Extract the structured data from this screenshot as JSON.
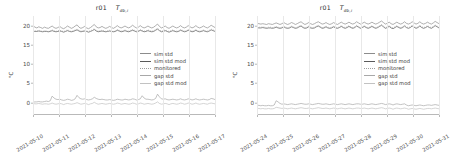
{
  "figure": {
    "panel_count": 2,
    "ylabel": "°C",
    "yticks": [
      0,
      5,
      10,
      15,
      20
    ],
    "ylim": [
      -3.2,
      22.5
    ],
    "legend_position": "center-right",
    "grid": "vertical-daily"
  },
  "chart_data": [
    {
      "type": "line",
      "title": "r01",
      "title_symbol": "T",
      "title_subscript": "db,i",
      "xlabel": "",
      "ylabel": "°C",
      "ylim": [
        -3.2,
        22.5
      ],
      "yticks": [
        0,
        5,
        10,
        15,
        20
      ],
      "x": [
        "2021-05-10",
        "2021-05-11",
        "2021-05-12",
        "2021-05-13",
        "2021-05-14",
        "2021-05-15",
        "2021-05-16",
        "2021-05-17"
      ],
      "legend": [
        "sim std",
        "sim std mod",
        "monitored",
        "gap std",
        "gap std mod"
      ],
      "colors": {
        "sim std": "#8c8c8c",
        "sim std mod": "#5a5a5a",
        "monitored": "#9e9e9e",
        "gap std": "#a8a8a8",
        "gap std mod": "#c2c2c2"
      },
      "series": [
        {
          "name": "sim std",
          "values": [
            20.0,
            19.6,
            19.4,
            19.7,
            19.5,
            19.3,
            19.6,
            19.4,
            19.3,
            19.6,
            19.9,
            19.5,
            19.3,
            19.5,
            19.8,
            19.4,
            19.2,
            19.5,
            19.9,
            19.6,
            19.3,
            19.5,
            19.9,
            20.2,
            19.6,
            19.3,
            19.5,
            19.8,
            19.4,
            19.2,
            19.5,
            19.9,
            20.3,
            19.7,
            19.4,
            19.5,
            19.8,
            19.5,
            19.3,
            19.5,
            19.8,
            19.5,
            19.3,
            19.6,
            20.0,
            19.6,
            19.4,
            19.6,
            19.9,
            19.6,
            19.4,
            19.7,
            20.1,
            19.7,
            19.4,
            19.6,
            20.0,
            19.6,
            19.4,
            19.6,
            19.9,
            19.6,
            19.4,
            19.6,
            20.0,
            20.4,
            19.8,
            19.4,
            19.6,
            19.9,
            19.5,
            19.3,
            19.6,
            19.9,
            19.6,
            19.4,
            19.6,
            20.0,
            19.6,
            19.4,
            19.6,
            20.0,
            19.7,
            19.4,
            19.6,
            20.0,
            19.6,
            19.4,
            19.6,
            19.9,
            19.6,
            19.4,
            19.7,
            20.1,
            19.8,
            19.5
          ]
        },
        {
          "name": "sim std mod",
          "values": [
            18.6,
            18.5,
            18.5,
            18.6,
            18.5,
            18.4,
            18.5,
            18.5,
            18.4,
            18.5,
            18.7,
            18.5,
            18.4,
            18.5,
            18.6,
            18.5,
            18.3,
            18.5,
            18.7,
            18.5,
            18.4,
            18.5,
            18.7,
            18.9,
            18.6,
            18.4,
            18.5,
            18.6,
            18.5,
            18.3,
            18.5,
            18.7,
            19.0,
            18.6,
            18.4,
            18.5,
            18.6,
            18.5,
            18.4,
            18.5,
            18.6,
            18.5,
            18.4,
            18.5,
            18.8,
            18.6,
            18.4,
            18.5,
            18.7,
            18.5,
            18.4,
            18.6,
            18.8,
            18.6,
            18.4,
            18.5,
            18.8,
            18.6,
            18.4,
            18.5,
            18.7,
            18.5,
            18.4,
            18.5,
            18.8,
            19.1,
            18.7,
            18.4,
            18.5,
            18.7,
            18.5,
            18.3,
            18.5,
            18.7,
            18.5,
            18.4,
            18.5,
            18.8,
            18.6,
            18.4,
            18.5,
            18.8,
            18.6,
            18.4,
            18.5,
            18.8,
            18.5,
            18.4,
            18.5,
            18.7,
            18.5,
            18.4,
            18.6,
            18.9,
            18.7,
            18.5
          ]
        },
        {
          "name": "monitored",
          "values": [
            18.8,
            18.6,
            18.6,
            18.8,
            18.7,
            18.5,
            18.7,
            18.6,
            18.5,
            18.7,
            18.9,
            18.7,
            18.5,
            18.7,
            18.8,
            18.6,
            18.5,
            18.7,
            18.9,
            18.7,
            18.5,
            18.7,
            18.9,
            19.1,
            18.8,
            18.6,
            18.7,
            18.8,
            18.6,
            18.5,
            18.7,
            18.9,
            19.2,
            18.8,
            18.6,
            18.7,
            18.8,
            18.7,
            18.5,
            18.7,
            18.8,
            18.7,
            18.5,
            18.7,
            19.0,
            18.8,
            18.6,
            18.7,
            18.9,
            18.7,
            18.6,
            18.8,
            19.0,
            18.8,
            18.6,
            18.7,
            19.0,
            18.8,
            18.6,
            18.7,
            18.9,
            18.7,
            18.6,
            18.7,
            19.0,
            19.3,
            18.9,
            18.6,
            18.7,
            18.9,
            18.7,
            18.5,
            18.7,
            18.9,
            18.7,
            18.6,
            18.7,
            19.0,
            18.8,
            18.6,
            18.7,
            19.0,
            18.8,
            18.6,
            18.7,
            19.0,
            18.7,
            18.6,
            18.7,
            18.9,
            18.7,
            18.6,
            18.8,
            19.1,
            18.9,
            18.7
          ]
        },
        {
          "name": "gap std",
          "values": [
            0.1,
            0.2,
            0.2,
            0.3,
            0.2,
            0.2,
            0.3,
            0.4,
            0.3,
            0.5,
            1.7,
            1.2,
            0.9,
            0.8,
            0.9,
            0.7,
            0.6,
            0.7,
            0.9,
            0.8,
            0.6,
            0.7,
            1.0,
            1.9,
            1.3,
            1.0,
            0.9,
            1.0,
            0.8,
            0.7,
            0.8,
            1.0,
            1.4,
            1.1,
            0.9,
            0.8,
            0.9,
            0.8,
            0.7,
            0.7,
            0.8,
            0.7,
            0.6,
            0.7,
            0.9,
            0.8,
            0.7,
            0.7,
            0.9,
            0.8,
            0.7,
            0.8,
            1.0,
            0.9,
            0.7,
            0.8,
            1.0,
            1.8,
            1.2,
            0.9,
            0.9,
            0.8,
            0.7,
            0.8,
            1.1,
            2.2,
            1.5,
            1.0,
            0.9,
            1.0,
            0.8,
            0.7,
            0.8,
            0.9,
            0.8,
            0.7,
            0.8,
            1.0,
            0.8,
            0.7,
            0.8,
            1.0,
            0.9,
            0.7,
            0.8,
            1.0,
            0.8,
            0.7,
            0.8,
            0.9,
            0.8,
            0.7,
            0.8,
            1.1,
            1.0,
            0.8
          ]
        },
        {
          "name": "gap std mod",
          "values": [
            -0.2,
            -0.3,
            -0.3,
            -0.2,
            -0.3,
            -0.4,
            -0.3,
            -0.3,
            -0.4,
            -0.3,
            -0.1,
            -0.3,
            -0.4,
            -0.3,
            -0.2,
            -0.3,
            -0.5,
            -0.3,
            -0.2,
            -0.3,
            -0.4,
            -0.3,
            -0.2,
            0.0,
            -0.2,
            -0.4,
            -0.3,
            -0.2,
            -0.3,
            -0.5,
            -0.3,
            -0.2,
            0.1,
            -0.2,
            -0.4,
            -0.3,
            -0.2,
            -0.3,
            -0.4,
            -0.3,
            -0.2,
            -0.3,
            -0.4,
            -0.3,
            -0.1,
            -0.2,
            -0.4,
            -0.3,
            -0.2,
            -0.3,
            -0.4,
            -0.3,
            -0.1,
            -0.2,
            -0.4,
            -0.3,
            -0.1,
            -0.2,
            -0.4,
            -0.3,
            -0.2,
            -0.3,
            -0.4,
            -0.3,
            -0.1,
            0.2,
            -0.2,
            -0.4,
            -0.3,
            -0.2,
            -0.3,
            -0.5,
            -0.3,
            -0.2,
            -0.3,
            -0.4,
            -0.3,
            -0.1,
            -0.2,
            -0.4,
            -0.3,
            -0.1,
            -0.2,
            -0.4,
            -0.3,
            -0.1,
            -0.3,
            -0.4,
            -0.3,
            -0.2,
            -0.3,
            -0.4,
            -0.2,
            -0.1,
            -0.2,
            -0.3
          ]
        }
      ]
    },
    {
      "type": "line",
      "title": "r01",
      "title_symbol": "T",
      "title_subscript": "db,i",
      "xlabel": "",
      "ylabel": "°C",
      "ylim": [
        -3.2,
        22.5
      ],
      "yticks": [
        0,
        5,
        10,
        15,
        20
      ],
      "x": [
        "2021-05-24",
        "2021-05-25",
        "2021-05-26",
        "2021-05-27",
        "2021-05-28",
        "2021-05-29",
        "2021-05-30",
        "2021-05-31"
      ],
      "legend": [
        "sim std",
        "sim std mod",
        "monitored",
        "gap std",
        "gap std mod"
      ],
      "colors": {
        "sim std": "#8c8c8c",
        "sim std mod": "#5a5a5a",
        "monitored": "#9e9e9e",
        "gap std": "#a8a8a8",
        "gap std mod": "#c2c2c2"
      },
      "series": [
        {
          "name": "sim std",
          "values": [
            20.6,
            20.5,
            20.4,
            20.5,
            20.4,
            20.3,
            20.5,
            20.4,
            20.3,
            20.5,
            20.7,
            20.5,
            20.3,
            20.5,
            20.8,
            20.5,
            20.3,
            20.5,
            20.8,
            20.6,
            20.3,
            20.5,
            20.8,
            21.0,
            20.6,
            20.3,
            20.5,
            20.8,
            20.5,
            20.3,
            20.5,
            20.8,
            21.0,
            20.7,
            20.4,
            20.5,
            20.8,
            20.5,
            20.3,
            20.5,
            20.8,
            20.5,
            20.3,
            20.6,
            20.9,
            20.6,
            20.4,
            20.6,
            20.9,
            20.6,
            20.4,
            20.6,
            21.0,
            20.7,
            20.4,
            20.6,
            20.9,
            20.6,
            20.4,
            20.6,
            20.9,
            20.6,
            20.4,
            20.6,
            20.9,
            21.2,
            20.8,
            20.4,
            20.6,
            20.9,
            20.5,
            20.3,
            20.6,
            20.9,
            20.6,
            20.4,
            20.6,
            21.0,
            20.6,
            20.4,
            20.6,
            21.0,
            20.7,
            20.4,
            20.6,
            21.0,
            20.6,
            20.4,
            20.6,
            20.9,
            20.6,
            20.4,
            20.7,
            21.1,
            20.8,
            20.5
          ]
        },
        {
          "name": "sim std mod",
          "values": [
            19.5,
            19.4,
            19.4,
            19.5,
            19.4,
            19.3,
            19.4,
            19.4,
            19.3,
            19.4,
            19.6,
            19.4,
            19.3,
            19.4,
            19.7,
            19.4,
            19.3,
            19.4,
            19.7,
            19.5,
            19.3,
            19.4,
            19.7,
            19.9,
            19.5,
            19.3,
            19.4,
            19.7,
            19.4,
            19.3,
            19.4,
            19.7,
            19.9,
            19.6,
            19.3,
            19.4,
            19.7,
            19.4,
            19.3,
            19.4,
            19.7,
            19.4,
            19.3,
            19.5,
            19.8,
            19.5,
            19.3,
            19.5,
            19.8,
            19.5,
            19.3,
            19.5,
            19.9,
            19.6,
            19.3,
            19.5,
            19.8,
            19.5,
            19.3,
            19.5,
            19.8,
            19.5,
            19.3,
            19.5,
            19.8,
            20.1,
            19.7,
            19.3,
            19.5,
            19.8,
            19.4,
            19.2,
            19.5,
            19.8,
            19.5,
            19.3,
            19.5,
            19.9,
            19.5,
            19.3,
            19.5,
            19.9,
            19.6,
            19.3,
            19.5,
            19.9,
            19.5,
            19.3,
            19.5,
            19.8,
            19.5,
            19.3,
            19.6,
            20.0,
            19.7,
            19.4
          ]
        },
        {
          "name": "monitored",
          "values": [
            19.7,
            19.6,
            19.6,
            19.7,
            19.6,
            19.5,
            19.6,
            19.6,
            19.5,
            19.6,
            19.8,
            19.6,
            19.5,
            19.6,
            19.9,
            19.6,
            19.5,
            19.6,
            19.9,
            19.7,
            19.5,
            19.6,
            19.9,
            20.1,
            19.7,
            19.5,
            19.6,
            19.9,
            19.6,
            19.5,
            19.6,
            19.9,
            20.1,
            19.8,
            19.5,
            19.6,
            19.9,
            19.6,
            19.5,
            19.6,
            19.9,
            19.6,
            19.5,
            19.7,
            20.0,
            19.7,
            19.5,
            19.7,
            20.0,
            19.7,
            19.5,
            19.7,
            20.1,
            19.8,
            19.5,
            19.7,
            20.0,
            19.7,
            19.5,
            19.7,
            20.0,
            19.7,
            19.5,
            19.7,
            20.0,
            20.3,
            19.9,
            19.5,
            19.7,
            20.0,
            19.6,
            19.4,
            19.7,
            20.0,
            19.7,
            19.5,
            19.7,
            20.1,
            19.7,
            19.5,
            19.7,
            20.1,
            19.8,
            19.5,
            19.7,
            20.1,
            19.7,
            19.5,
            19.7,
            20.0,
            19.7,
            19.5,
            19.8,
            20.2,
            19.9,
            19.6
          ]
        },
        {
          "name": "gap std",
          "values": [
            -0.7,
            -0.7,
            -0.8,
            -0.7,
            -0.8,
            -0.8,
            -0.7,
            -0.8,
            -0.8,
            -0.6,
            0.5,
            0.2,
            -0.2,
            -0.4,
            -0.3,
            -0.4,
            -0.5,
            -0.4,
            -0.3,
            -0.4,
            -0.5,
            -0.4,
            -0.3,
            -0.2,
            -0.3,
            -0.4,
            -0.4,
            -0.3,
            -0.4,
            -0.5,
            -0.4,
            -0.3,
            -0.2,
            -0.3,
            -0.4,
            -0.4,
            -0.3,
            -0.4,
            -0.5,
            -0.4,
            -0.3,
            -0.4,
            -0.5,
            -0.4,
            -0.3,
            -0.4,
            -0.5,
            -0.4,
            -0.3,
            -0.4,
            -0.5,
            -0.4,
            -0.3,
            -0.3,
            -0.4,
            -0.4,
            -0.3,
            -0.4,
            -0.5,
            -0.4,
            -0.3,
            -0.4,
            -0.5,
            -0.4,
            -0.3,
            -0.2,
            -0.3,
            -0.5,
            -0.4,
            -0.3,
            -0.4,
            -0.6,
            -0.4,
            -0.3,
            -0.4,
            -0.5,
            -0.4,
            -0.3,
            -0.6,
            -0.8,
            -0.7,
            -0.6,
            -0.7,
            -0.8,
            -0.7,
            -0.6,
            -0.7,
            -0.8,
            -0.7,
            -0.6,
            -0.6,
            -0.7,
            -0.6,
            -0.5,
            -0.6,
            -0.7
          ]
        },
        {
          "name": "gap std mod",
          "values": [
            -1.5,
            -1.5,
            -1.6,
            -1.5,
            -1.6,
            -1.6,
            -1.5,
            -1.6,
            -1.6,
            -1.5,
            -1.2,
            -1.3,
            -1.4,
            -1.5,
            -1.4,
            -1.5,
            -1.6,
            -1.5,
            -1.4,
            -1.5,
            -1.6,
            -1.5,
            -1.4,
            -1.3,
            -1.4,
            -1.5,
            -1.5,
            -1.4,
            -1.5,
            -1.6,
            -1.5,
            -1.4,
            -1.3,
            -1.4,
            -1.5,
            -1.5,
            -1.4,
            -1.5,
            -1.6,
            -1.5,
            -1.4,
            -1.5,
            -1.6,
            -1.5,
            -1.4,
            -1.5,
            -1.6,
            -1.5,
            -1.4,
            -1.5,
            -1.6,
            -1.5,
            -1.4,
            -1.4,
            -1.5,
            -1.5,
            -1.4,
            -1.5,
            -1.6,
            -1.5,
            -1.4,
            -1.5,
            -1.6,
            -1.5,
            -1.4,
            -1.3,
            -1.4,
            -1.6,
            -1.5,
            -1.4,
            -1.5,
            -1.7,
            -1.5,
            -1.4,
            -1.5,
            -1.6,
            -1.5,
            -1.4,
            -1.5,
            -1.7,
            -1.6,
            -1.5,
            -1.6,
            -1.7,
            -1.6,
            -1.5,
            -1.6,
            -1.7,
            -1.6,
            -1.5,
            -1.5,
            -1.6,
            -1.5,
            -1.4,
            -1.5,
            -1.6
          ]
        }
      ]
    }
  ]
}
